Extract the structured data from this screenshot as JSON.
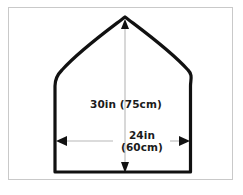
{
  "figure": {
    "type": "technical-drawing",
    "background_color": "#ffffff",
    "frame_color": "#c9c9c9",
    "outline_color": "#111111",
    "dimension_line_color": "#cccccc",
    "arrowhead_color": "#111111",
    "text_color": "#1b1b1b"
  },
  "dimensions": {
    "height": {
      "label": "30in  (75cm)",
      "imperial_value": 30,
      "imperial_unit": "in",
      "metric_value": 75,
      "metric_unit": "cm",
      "orientation": "vertical"
    },
    "width": {
      "label_line1": "24in",
      "label_line2": "(60cm)",
      "imperial_value": 24,
      "imperial_unit": "in",
      "metric_value": 60,
      "metric_unit": "cm",
      "orientation": "horizontal"
    }
  },
  "shape_geometry": {
    "apex_x": 125,
    "apex_y": 18,
    "left_wall_x": 55,
    "right_wall_x": 190,
    "shoulder_y": 76,
    "baseline_y": 172
  }
}
